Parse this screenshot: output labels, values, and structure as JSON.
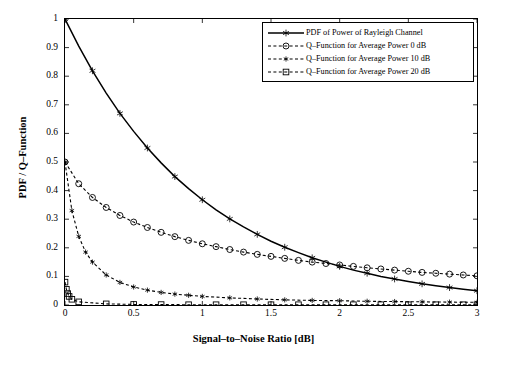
{
  "chart_data": {
    "type": "line",
    "title": "",
    "xlabel": "Signal–to–Noise Ratio [dB]",
    "ylabel": "PDF / Q–Function",
    "xlim": [
      0,
      3
    ],
    "ylim": [
      0,
      1
    ],
    "xticks": [
      0,
      0.5,
      1,
      1.5,
      2,
      2.5,
      3
    ],
    "xticklabels": [
      "0",
      "0.5",
      "1",
      "1.5",
      "2",
      "2.5",
      "3"
    ],
    "yticks": [
      0,
      0.1,
      0.2,
      0.3,
      0.4,
      0.5,
      0.6,
      0.7,
      0.8,
      0.9,
      1
    ],
    "yticklabels": [
      "0",
      "0.1",
      "0.2",
      "0.3",
      "0.4",
      "0.5",
      "0.6",
      "0.7",
      "0.8",
      "0.9",
      "1"
    ],
    "grid": false,
    "legend_position": "top-right",
    "series": [
      {
        "name": "PDF of Power of Rayleigh Channel",
        "marker": "star",
        "linestyle": "solid",
        "color": "#000000",
        "x": [
          0,
          0.1,
          0.2,
          0.3,
          0.4,
          0.5,
          0.6,
          0.7,
          0.8,
          0.9,
          1.0,
          1.1,
          1.2,
          1.3,
          1.4,
          1.5,
          1.6,
          1.7,
          1.8,
          1.9,
          2.0,
          2.1,
          2.2,
          2.3,
          2.4,
          2.5,
          2.6,
          2.7,
          2.8,
          2.9,
          3.0
        ],
        "y": [
          1.0,
          0.905,
          0.819,
          0.741,
          0.67,
          0.607,
          0.549,
          0.497,
          0.449,
          0.407,
          0.368,
          0.333,
          0.301,
          0.273,
          0.247,
          0.223,
          0.202,
          0.183,
          0.165,
          0.15,
          0.135,
          0.122,
          0.111,
          0.1,
          0.091,
          0.082,
          0.074,
          0.067,
          0.061,
          0.055,
          0.05
        ]
      },
      {
        "name": "Q–Function for Average Power 0 dB",
        "marker": "circle",
        "linestyle": "dashed",
        "color": "#000000",
        "x": [
          0,
          0.1,
          0.2,
          0.3,
          0.4,
          0.5,
          0.6,
          0.7,
          0.8,
          0.9,
          1.0,
          1.1,
          1.2,
          1.3,
          1.4,
          1.5,
          1.6,
          1.7,
          1.8,
          1.9,
          2.0,
          2.1,
          2.2,
          2.3,
          2.4,
          2.5,
          2.6,
          2.7,
          2.8,
          2.9,
          3.0
        ],
        "y": [
          0.5,
          0.424,
          0.376,
          0.341,
          0.313,
          0.29,
          0.271,
          0.254,
          0.239,
          0.226,
          0.214,
          0.204,
          0.194,
          0.185,
          0.177,
          0.17,
          0.163,
          0.156,
          0.15,
          0.145,
          0.14,
          0.135,
          0.13,
          0.126,
          0.122,
          0.118,
          0.114,
          0.111,
          0.108,
          0.105,
          0.102
        ]
      },
      {
        "name": "Q–Function for Average Power 10 dB",
        "marker": "star-small",
        "linestyle": "dashed",
        "color": "#000000",
        "x": [
          0,
          0.05,
          0.1,
          0.15,
          0.2,
          0.3,
          0.4,
          0.5,
          0.6,
          0.7,
          0.8,
          0.9,
          1.0,
          1.2,
          1.4,
          1.6,
          1.8,
          2.0,
          2.2,
          2.4,
          2.6,
          2.8,
          3.0
        ],
        "y": [
          0.5,
          0.33,
          0.24,
          0.185,
          0.15,
          0.105,
          0.079,
          0.063,
          0.052,
          0.044,
          0.038,
          0.034,
          0.03,
          0.025,
          0.021,
          0.018,
          0.016,
          0.015,
          0.013,
          0.012,
          0.011,
          0.01,
          0.0095
        ]
      },
      {
        "name": "Q–Function for Average Power 20 dB",
        "marker": "square",
        "linestyle": "dashed",
        "color": "#000000",
        "x": [
          0,
          0.01,
          0.02,
          0.03,
          0.05,
          0.1,
          0.3,
          0.5,
          0.7,
          0.9,
          1.1,
          1.3,
          1.5,
          1.7,
          1.9,
          2.1,
          2.3,
          2.5,
          2.7,
          2.9,
          3.0
        ],
        "y": [
          0.08,
          0.055,
          0.04,
          0.03,
          0.02,
          0.011,
          0.004,
          0.002,
          0.0015,
          0.001,
          0.001,
          0.001,
          0.001,
          0.001,
          0.001,
          0.001,
          0.001,
          0.001,
          0.001,
          0.001,
          0.001
        ]
      }
    ],
    "legend_entries": [
      "PDF of Power of Rayleigh Channel",
      "Q–Function for Average Power 0 dB",
      "Q–Function for Average Power 10 dB",
      "Q–Function for Average Power 20 dB"
    ]
  }
}
